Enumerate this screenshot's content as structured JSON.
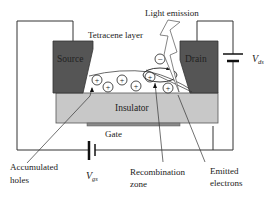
{
  "diagram": {
    "labels": {
      "source": "Source",
      "drain": "Drain",
      "insulator": "Insulator",
      "gate": "Gate",
      "tetracene_layer": "Tetracene layer",
      "light_emission": "Light emission",
      "vds_symbol": "V",
      "vds_sub": "ds",
      "vgs_symbol": "V",
      "vgs_sub": "gs",
      "accumulated_holes_line1": "Accumulated",
      "accumulated_holes_line2": "holes",
      "recombination_zone_line1": "Recombination",
      "recombination_zone_line2": "zone",
      "emitted_electrons_line1": "Emitted",
      "emitted_electrons_line2": "electrons"
    },
    "charges": {
      "hole_symbol": "+",
      "electron_symbol": "−",
      "hole_count": 8,
      "electron_count": 1
    },
    "colors": {
      "electrode": "#555555",
      "insulator": "#c8c8c8",
      "gate": "#8a8a8a",
      "wire": "#333333",
      "background": "#ffffff"
    }
  }
}
